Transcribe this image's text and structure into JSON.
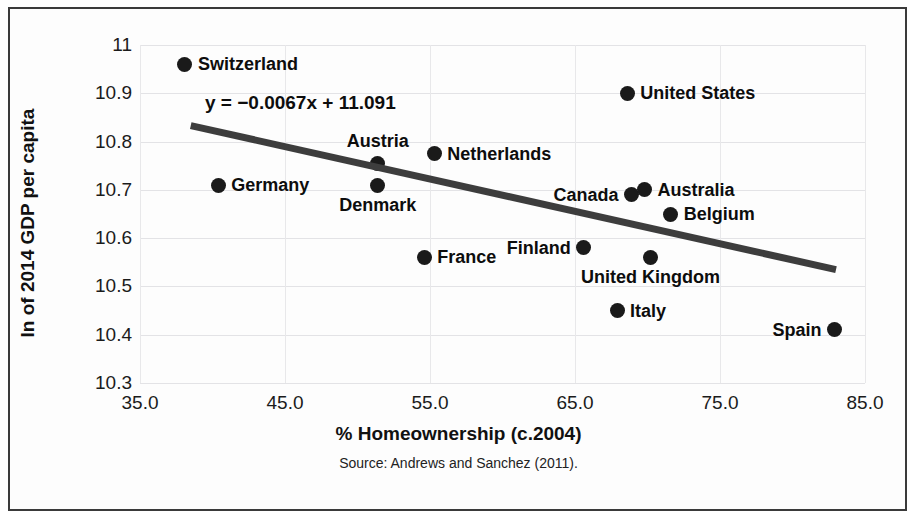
{
  "chart_data": {
    "type": "scatter",
    "title": "",
    "xlabel": "% Homeownership (c.2004)",
    "ylabel": "ln of 2014 GDP per capita",
    "source": "Source: Andrews and Sanchez (2011).",
    "xlim": [
      35.0,
      85.0
    ],
    "ylim": [
      10.3,
      11.0
    ],
    "xticks": [
      "35.0",
      "45.0",
      "55.0",
      "65.0",
      "75.0",
      "85.0"
    ],
    "xtick_values": [
      35.0,
      45.0,
      55.0,
      65.0,
      75.0,
      85.0
    ],
    "yticks": [
      "10.3",
      "10.4",
      "10.5",
      "10.6",
      "10.7",
      "10.8",
      "10.9",
      "11"
    ],
    "ytick_values": [
      10.3,
      10.4,
      10.5,
      10.6,
      10.7,
      10.8,
      10.9,
      11.0
    ],
    "grid": true,
    "legend": "none",
    "marker_color": "#1a1a1a",
    "trendline_color": "#3d3d3d",
    "trendline": {
      "equation": "y = −0.0067x + 11.091",
      "slope": -0.0067,
      "intercept": 11.091,
      "x_start": 38.5,
      "x_end": 83.0
    },
    "points": [
      {
        "label": "Switzerland",
        "x": 38.1,
        "y": 10.96,
        "label_pos": "right"
      },
      {
        "label": "Germany",
        "x": 40.4,
        "y": 10.71,
        "label_pos": "right"
      },
      {
        "label": "Denmark",
        "x": 51.4,
        "y": 10.71,
        "label_pos": "below"
      },
      {
        "label": "Austria",
        "x": 51.4,
        "y": 10.755,
        "label_pos": "above"
      },
      {
        "label": "Netherlands",
        "x": 55.3,
        "y": 10.775,
        "label_pos": "right"
      },
      {
        "label": "France",
        "x": 54.6,
        "y": 10.56,
        "label_pos": "right"
      },
      {
        "label": "Finland",
        "x": 65.6,
        "y": 10.58,
        "label_pos": "left"
      },
      {
        "label": "United States",
        "x": 68.6,
        "y": 10.9,
        "label_pos": "right"
      },
      {
        "label": "Canada",
        "x": 68.9,
        "y": 10.69,
        "label_pos": "left"
      },
      {
        "label": "Australia",
        "x": 69.8,
        "y": 10.7,
        "label_pos": "right"
      },
      {
        "label": "Belgium",
        "x": 71.6,
        "y": 10.65,
        "label_pos": "right"
      },
      {
        "label": "United Kingdom",
        "x": 70.2,
        "y": 10.56,
        "label_pos": "below"
      },
      {
        "label": "Italy",
        "x": 67.9,
        "y": 10.45,
        "label_pos": "right"
      },
      {
        "label": "Spain",
        "x": 82.9,
        "y": 10.41,
        "label_pos": "left"
      }
    ]
  }
}
